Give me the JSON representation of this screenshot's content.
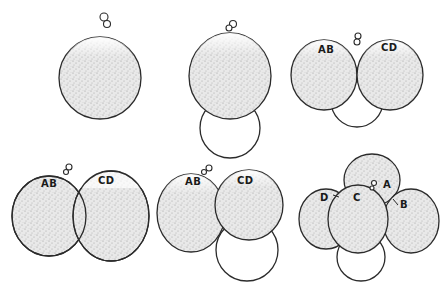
{
  "figure": {
    "panels": [
      {
        "id": "stage-1",
        "labels": []
      },
      {
        "id": "stage-2",
        "labels": []
      },
      {
        "id": "stage-3",
        "labels": [
          "AB",
          "CD"
        ]
      },
      {
        "id": "stage-4",
        "labels": [
          "AB",
          "CD"
        ]
      },
      {
        "id": "stage-5",
        "labels": [
          "AB",
          "CD"
        ]
      },
      {
        "id": "stage-6",
        "labels": [
          "A",
          "B",
          "C",
          "D"
        ]
      }
    ]
  }
}
